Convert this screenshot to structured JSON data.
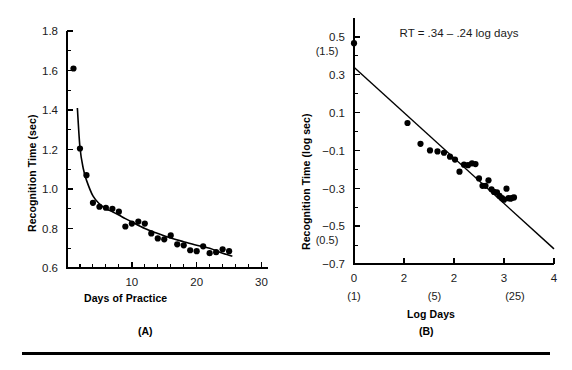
{
  "figure": {
    "panels": [
      {
        "id": "A",
        "label": "(A)",
        "xlabel": "Days of Practice",
        "ylabel": "Recognition Time (sec)"
      },
      {
        "id": "B",
        "label": "(B)",
        "xlabel": "Log Days",
        "ylabel": "Recognition Time (log sec)",
        "equation": "RT = .34 – .24 log days"
      }
    ],
    "divider_color": "#000000"
  },
  "chart_data": [
    {
      "type": "scatter",
      "panel": "A",
      "title": "",
      "xlabel": "Days of Practice",
      "ylabel": "Recognition Time (sec)",
      "xlim": [
        0,
        31
      ],
      "ylim": [
        0.6,
        1.8
      ],
      "xticks": [
        10,
        20,
        30
      ],
      "xtick_labels": [
        "10",
        "20",
        "30"
      ],
      "xminor_step": 2,
      "yticks": [
        0.6,
        0.8,
        1.0,
        1.2,
        1.4,
        1.6,
        1.8
      ],
      "ytick_labels": [
        "0.6",
        "0.8",
        "1.0",
        "1.2",
        "1.4",
        "1.6",
        "1.8"
      ],
      "yminor_step": 0.1,
      "grid": false,
      "legend": "none",
      "series": [
        {
          "name": "Observed recognition time",
          "marker": "filled-circle",
          "x": [
            1,
            2,
            3,
            4,
            5,
            6,
            7,
            8,
            9,
            10,
            11,
            12,
            13,
            14,
            15,
            16,
            17,
            18,
            19,
            20,
            21,
            22,
            23,
            24,
            25
          ],
          "y": [
            1.61,
            1.205,
            1.07,
            0.93,
            0.91,
            0.905,
            0.9,
            0.885,
            0.81,
            0.825,
            0.835,
            0.825,
            0.775,
            0.75,
            0.745,
            0.765,
            0.72,
            0.715,
            0.69,
            0.685,
            0.71,
            0.675,
            0.68,
            0.695,
            0.685
          ]
        },
        {
          "name": "Power function fit",
          "marker": "line",
          "x": [
            1.6,
            2,
            2.5,
            3,
            4,
            5,
            6,
            7,
            8,
            9,
            10,
            12,
            14,
            16,
            18,
            20,
            22,
            24,
            25.5
          ],
          "y": [
            1.41,
            1.21,
            1.105,
            1.045,
            0.965,
            0.925,
            0.9,
            0.885,
            0.868,
            0.85,
            0.833,
            0.8,
            0.775,
            0.752,
            0.733,
            0.715,
            0.7,
            0.675,
            0.66
          ]
        }
      ]
    },
    {
      "type": "scatter",
      "panel": "B",
      "title": "RT = .34 – .24 log days",
      "xlabel": "Log Days",
      "ylabel": "Recognition Time (log sec)",
      "xlim": [
        0,
        4
      ],
      "ylim": [
        -0.7,
        0.6
      ],
      "xticks": [
        0,
        1,
        2,
        3,
        4
      ],
      "xtick_labels": [
        "0",
        "2",
        "2",
        "3",
        "4"
      ],
      "xtick_sublabels": [
        "(1)",
        "",
        "(5)",
        "",
        "(25)"
      ],
      "xsublabel_positions": [
        0,
        1.609,
        3.219
      ],
      "yticks": [
        -0.7,
        -0.5,
        -0.3,
        -0.1,
        0.1,
        0.3,
        0.5
      ],
      "ytick_labels": [
        "−0.7",
        "−0.5",
        "−0.3",
        "−0.1",
        "0.1",
        "0.3",
        "0.5"
      ],
      "ytick_sublabels": {
        "0.5": "(1.5)",
        "-0.5": "(0.5)"
      },
      "yminor_step": 0.1,
      "grid": false,
      "legend": "none",
      "annotations": [
        {
          "text": "RT = .34 – .24 log days",
          "x": 2.1,
          "y": 0.52
        }
      ],
      "series": [
        {
          "name": "Observed log recognition time",
          "marker": "filled-circle",
          "x": [
            0.0,
            1.07,
            1.33,
            1.52,
            1.67,
            1.8,
            1.92,
            2.02,
            2.11,
            2.2,
            2.28,
            2.36,
            2.43,
            2.5,
            2.57,
            2.63,
            2.69,
            2.75,
            2.8,
            2.86,
            2.91,
            2.96,
            3.0,
            3.05,
            3.09,
            3.13,
            3.17,
            3.2
          ],
          "y": [
            0.467,
            0.045,
            -0.065,
            -0.1,
            -0.105,
            -0.112,
            -0.133,
            -0.148,
            -0.212,
            -0.175,
            -0.178,
            -0.168,
            -0.172,
            -0.248,
            -0.287,
            -0.287,
            -0.258,
            -0.305,
            -0.319,
            -0.322,
            -0.34,
            -0.352,
            -0.36,
            -0.302,
            -0.352,
            -0.355,
            -0.35,
            -0.348
          ]
        },
        {
          "name": "Regression line",
          "marker": "line",
          "x": [
            0,
            4
          ],
          "y": [
            0.34,
            -0.62
          ]
        }
      ]
    }
  ]
}
